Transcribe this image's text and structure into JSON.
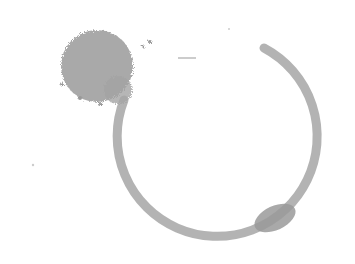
{
  "image": {
    "description": "Grayscale coffee/ink stain: splatter blob at upper-left connected to an open circular ring",
    "colors": {
      "background": "#ffffff",
      "stain": "#9a9a9a",
      "stain_light": "#bdbdbd",
      "stain_dark": "#8c8c8c"
    }
  }
}
